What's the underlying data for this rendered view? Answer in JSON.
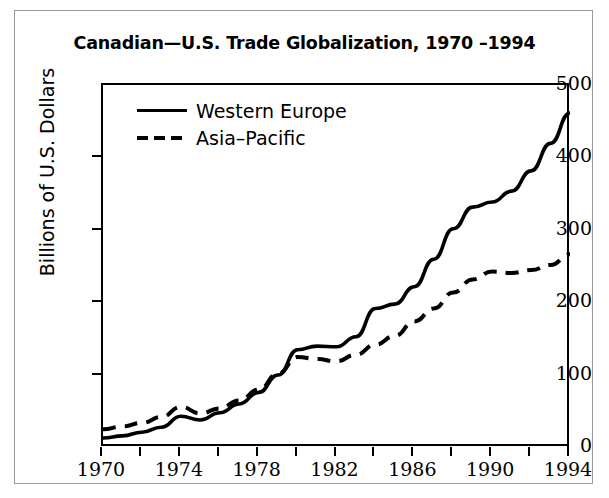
{
  "chart_data": {
    "type": "line",
    "title": "Canadian—U.S. Trade Globalization, 1970 –1994",
    "xlabel": "",
    "ylabel": "Billions of U.S. Dollars",
    "xlim": [
      1970,
      1994
    ],
    "ylim": [
      0,
      500
    ],
    "grid": false,
    "legend_position": "top-left",
    "y_ticks": [
      500,
      400,
      300,
      200,
      100,
      0
    ],
    "x_ticks": [
      1970,
      1972,
      1974,
      1976,
      1978,
      1980,
      1982,
      1984,
      1986,
      1988,
      1990,
      1992,
      1994
    ],
    "x_tick_labels": [
      "1970",
      "",
      "1974",
      "",
      "1978",
      "",
      "1982",
      "",
      "1986",
      "",
      "1990",
      "",
      "1994"
    ],
    "x": [
      1970,
      1971,
      1972,
      1973,
      1974,
      1975,
      1976,
      1977,
      1978,
      1979,
      1980,
      1981,
      1982,
      1983,
      1984,
      1985,
      1986,
      1987,
      1988,
      1989,
      1990,
      1991,
      1992,
      1993,
      1994
    ],
    "series": [
      {
        "name": "Western Europe",
        "style": "solid",
        "color": "#000000",
        "values": [
          11,
          14,
          19,
          26,
          41,
          36,
          46,
          58,
          74,
          98,
          133,
          138,
          137,
          151,
          190,
          196,
          220,
          258,
          300,
          330,
          337,
          352,
          380,
          418,
          460
        ]
      },
      {
        "name": "Asia–Pacific",
        "style": "dashed",
        "color": "#000000",
        "values": [
          23,
          27,
          32,
          40,
          54,
          45,
          52,
          63,
          78,
          100,
          123,
          120,
          117,
          126,
          140,
          152,
          172,
          190,
          212,
          230,
          241,
          239,
          243,
          250,
          265
        ]
      }
    ]
  },
  "legend": {
    "items": [
      {
        "label": "Western Europe",
        "style": "solid"
      },
      {
        "label": "Asia–Pacific",
        "style": "dashed"
      }
    ]
  }
}
